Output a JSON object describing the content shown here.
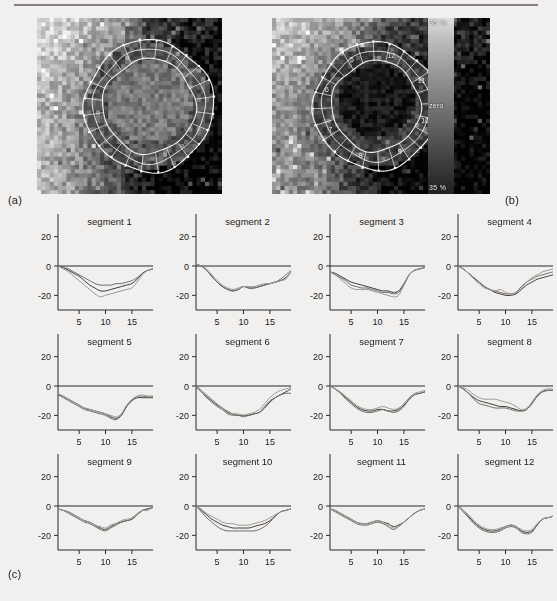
{
  "figure": {
    "panel_a_tag": "(a)",
    "panel_b_tag": "(b)",
    "panel_c_tag": "(c)"
  },
  "colorbar": {
    "top_label": "35 %",
    "mid_label": "zero",
    "bottom_label": "35 %",
    "high_color": "#dedede",
    "low_color": "#202020"
  },
  "mri": {
    "panel_a_name": "short-axis perfusion map with segmentation contours",
    "panel_b_name": "short-axis perfusion map with numbered segment contours",
    "segment_labels_on_image": [
      "12",
      "11",
      "10",
      "9",
      "8",
      "7",
      "6",
      "5"
    ]
  },
  "chart_data": {
    "type": "line",
    "title": "",
    "xlabel": "",
    "ylabel": "",
    "xlim": [
      1,
      19
    ],
    "ylim": [
      -30,
      30
    ],
    "xticks": [
      5,
      10,
      15
    ],
    "yticks": [
      20,
      0,
      -20
    ],
    "xtick_labels": [
      "5",
      "10",
      "15"
    ],
    "ytick_labels": [
      "20",
      "0",
      "-20"
    ],
    "grid": false,
    "legend": "none",
    "series_names": [
      "curve 1",
      "curve 2",
      "curve 3"
    ],
    "x": [
      1,
      2,
      3,
      4,
      5,
      6,
      7,
      8,
      9,
      10,
      11,
      12,
      13,
      14,
      15,
      16,
      17,
      18,
      19
    ],
    "panels": [
      {
        "title": "segment 1",
        "series": [
          {
            "name": "curve 1",
            "values": [
              0,
              -1,
              -3,
              -5,
              -7,
              -10,
              -13,
              -15,
              -17,
              -17,
              -16,
              -15,
              -14,
              -13,
              -12,
              -9,
              -5,
              -3,
              -2
            ]
          },
          {
            "name": "curve 2",
            "values": [
              0,
              -1,
              -2,
              -4,
              -6,
              -8,
              -10,
              -12,
              -13,
              -13,
              -13,
              -12,
              -12,
              -11,
              -10,
              -8,
              -5,
              -3,
              -2
            ]
          },
          {
            "name": "curve 3",
            "values": [
              0,
              -2,
              -4,
              -7,
              -10,
              -13,
              -16,
              -19,
              -21,
              -20,
              -19,
              -18,
              -17,
              -16,
              -15,
              -11,
              -6,
              -3,
              -2
            ]
          }
        ]
      },
      {
        "title": "segment 2",
        "series": [
          {
            "name": "curve 1",
            "values": [
              1,
              0,
              -3,
              -7,
              -11,
              -14,
              -16,
              -17,
              -16,
              -14,
              -15,
              -15,
              -14,
              -13,
              -12,
              -11,
              -10,
              -8,
              -4
            ]
          },
          {
            "name": "curve 2",
            "values": [
              1,
              0,
              -3,
              -7,
              -11,
              -14,
              -16,
              -17,
              -16,
              -14,
              -15,
              -15,
              -14,
              -13,
              -12,
              -11,
              -9,
              -6,
              -3
            ]
          },
          {
            "name": "curve 3",
            "values": [
              1,
              0,
              -2,
              -6,
              -10,
              -13,
              -15,
              -16,
              -15,
              -14,
              -14,
              -14,
              -13,
              -12,
              -12,
              -11,
              -10,
              -9,
              -4
            ]
          }
        ]
      },
      {
        "title": "segment 3",
        "series": [
          {
            "name": "curve 1",
            "values": [
              -4,
              -5,
              -7,
              -9,
              -11,
              -12,
              -13,
              -14,
              -15,
              -16,
              -17,
              -17,
              -18,
              -17,
              -12,
              -6,
              -3,
              -2,
              -1
            ]
          },
          {
            "name": "curve 2",
            "values": [
              -4,
              -6,
              -8,
              -10,
              -13,
              -14,
              -15,
              -15,
              -16,
              -17,
              -18,
              -18,
              -19,
              -18,
              -13,
              -6,
              -3,
              -2,
              -1
            ]
          },
          {
            "name": "curve 3",
            "values": [
              -4,
              -6,
              -9,
              -12,
              -15,
              -16,
              -16,
              -16,
              -17,
              -18,
              -19,
              -20,
              -21,
              -20,
              -13,
              -6,
              -3,
              -2,
              -1
            ]
          }
        ]
      },
      {
        "title": "segment 4",
        "series": [
          {
            "name": "curve 1",
            "values": [
              0,
              -2,
              -5,
              -8,
              -11,
              -14,
              -16,
              -18,
              -19,
              -20,
              -20,
              -19,
              -16,
              -13,
              -11,
              -9,
              -8,
              -7,
              -6
            ]
          },
          {
            "name": "curve 2",
            "values": [
              0,
              -2,
              -5,
              -8,
              -11,
              -14,
              -16,
              -17,
              -18,
              -19,
              -19,
              -18,
              -14,
              -11,
              -9,
              -7,
              -6,
              -5,
              -4
            ]
          },
          {
            "name": "curve 3",
            "values": [
              0,
              -2,
              -5,
              -9,
              -12,
              -15,
              -16,
              -17,
              -16,
              -18,
              -19,
              -18,
              -15,
              -11,
              -8,
              -6,
              -4,
              -3,
              -2
            ]
          }
        ]
      },
      {
        "title": "segment 5",
        "series": [
          {
            "name": "curve 1",
            "values": [
              -6,
              -7,
              -9,
              -11,
              -13,
              -15,
              -16,
              -17,
              -18,
              -19,
              -21,
              -22,
              -20,
              -14,
              -10,
              -8,
              -8,
              -8,
              -8
            ]
          },
          {
            "name": "curve 2",
            "values": [
              -6,
              -8,
              -10,
              -12,
              -14,
              -16,
              -17,
              -18,
              -19,
              -20,
              -22,
              -23,
              -20,
              -14,
              -10,
              -7,
              -7,
              -7,
              -7
            ]
          },
          {
            "name": "curve 3",
            "values": [
              -5,
              -7,
              -9,
              -11,
              -13,
              -15,
              -16,
              -17,
              -18,
              -19,
              -20,
              -21,
              -19,
              -13,
              -9,
              -7,
              -6,
              -7,
              -7
            ]
          }
        ]
      },
      {
        "title": "segment 6",
        "series": [
          {
            "name": "curve 1",
            "values": [
              0,
              -3,
              -7,
              -10,
              -13,
              -15,
              -18,
              -19,
              -20,
              -20,
              -20,
              -19,
              -18,
              -15,
              -11,
              -8,
              -6,
              -4,
              -2
            ]
          },
          {
            "name": "curve 2",
            "values": [
              -1,
              -4,
              -8,
              -11,
              -14,
              -16,
              -19,
              -20,
              -20,
              -21,
              -20,
              -19,
              -18,
              -14,
              -10,
              -8,
              -6,
              -5,
              -5
            ]
          },
          {
            "name": "curve 3",
            "values": [
              0,
              -3,
              -6,
              -9,
              -12,
              -15,
              -17,
              -19,
              -19,
              -20,
              -19,
              -18,
              -16,
              -12,
              -8,
              -5,
              -3,
              -2,
              -1
            ]
          }
        ]
      },
      {
        "title": "segment 7",
        "series": [
          {
            "name": "curve 1",
            "values": [
              0,
              -2,
              -5,
              -8,
              -11,
              -14,
              -16,
              -17,
              -17,
              -16,
              -16,
              -17,
              -17,
              -16,
              -13,
              -9,
              -6,
              -5,
              -4
            ]
          },
          {
            "name": "curve 2",
            "values": [
              0,
              -2,
              -5,
              -9,
              -12,
              -15,
              -17,
              -18,
              -18,
              -17,
              -16,
              -17,
              -18,
              -17,
              -14,
              -9,
              -6,
              -5,
              -4
            ]
          },
          {
            "name": "curve 3",
            "values": [
              0,
              -2,
              -4,
              -7,
              -10,
              -13,
              -15,
              -16,
              -16,
              -15,
              -14,
              -15,
              -16,
              -15,
              -12,
              -8,
              -5,
              -4,
              -3
            ]
          }
        ]
      },
      {
        "title": "segment 8",
        "series": [
          {
            "name": "curve 1",
            "values": [
              0,
              -2,
              -5,
              -8,
              -10,
              -11,
              -12,
              -13,
              -14,
              -14,
              -15,
              -16,
              -17,
              -16,
              -12,
              -7,
              -4,
              -3,
              -3
            ]
          },
          {
            "name": "curve 2",
            "values": [
              0,
              -2,
              -5,
              -9,
              -12,
              -13,
              -14,
              -15,
              -15,
              -15,
              -16,
              -17,
              -17,
              -16,
              -12,
              -7,
              -4,
              -3,
              -3
            ]
          },
          {
            "name": "curve 3",
            "values": [
              0,
              -1,
              -3,
              -6,
              -8,
              -9,
              -9,
              -9,
              -10,
              -11,
              -12,
              -14,
              -16,
              -15,
              -11,
              -6,
              -3,
              -2,
              -2
            ]
          }
        ]
      },
      {
        "title": "segment 9",
        "series": [
          {
            "name": "curve 1",
            "values": [
              -2,
              -3,
              -4,
              -6,
              -8,
              -10,
              -11,
              -13,
              -15,
              -16,
              -14,
              -12,
              -11,
              -10,
              -9,
              -6,
              -3,
              -2,
              -1
            ]
          },
          {
            "name": "curve 2",
            "values": [
              -2,
              -3,
              -5,
              -7,
              -9,
              -11,
              -12,
              -14,
              -16,
              -17,
              -15,
              -13,
              -11,
              -10,
              -9,
              -6,
              -3,
              -2,
              -1
            ]
          },
          {
            "name": "curve 3",
            "values": [
              -2,
              -3,
              -4,
              -6,
              -8,
              -10,
              -11,
              -13,
              -14,
              -15,
              -13,
              -12,
              -10,
              -9,
              -8,
              -5,
              -3,
              -3,
              -1
            ]
          }
        ]
      },
      {
        "title": "segment 10",
        "series": [
          {
            "name": "curve 1",
            "values": [
              0,
              -3,
              -6,
              -9,
              -11,
              -13,
              -14,
              -15,
              -15,
              -15,
              -15,
              -14,
              -13,
              -12,
              -10,
              -7,
              -4,
              -3,
              -2
            ]
          },
          {
            "name": "curve 2",
            "values": [
              0,
              -4,
              -8,
              -11,
              -14,
              -16,
              -17,
              -17,
              -17,
              -17,
              -17,
              -17,
              -16,
              -14,
              -11,
              -7,
              -4,
              -3,
              -2
            ]
          },
          {
            "name": "curve 3",
            "values": [
              0,
              -2,
              -5,
              -7,
              -9,
              -11,
              -12,
              -12,
              -13,
              -13,
              -13,
              -12,
              -11,
              -10,
              -8,
              -6,
              -4,
              -3,
              -2
            ]
          }
        ]
      },
      {
        "title": "segment 11",
        "series": [
          {
            "name": "curve 1",
            "values": [
              -2,
              -3,
              -5,
              -7,
              -9,
              -11,
              -12,
              -12,
              -11,
              -10,
              -11,
              -12,
              -14,
              -13,
              -11,
              -8,
              -5,
              -3,
              -2
            ]
          },
          {
            "name": "curve 2",
            "values": [
              -2,
              -4,
              -6,
              -8,
              -10,
              -12,
              -13,
              -13,
              -12,
              -11,
              -12,
              -14,
              -16,
              -14,
              -11,
              -8,
              -5,
              -3,
              -2
            ]
          },
          {
            "name": "curve 3",
            "values": [
              -2,
              -3,
              -5,
              -7,
              -9,
              -11,
              -12,
              -12,
              -11,
              -10,
              -11,
              -13,
              -15,
              -14,
              -11,
              -8,
              -5,
              -3,
              -2
            ]
          }
        ]
      },
      {
        "title": "segment 12",
        "series": [
          {
            "name": "curve 1",
            "values": [
              0,
              -3,
              -7,
              -11,
              -14,
              -16,
              -17,
              -17,
              -16,
              -14,
              -13,
              -14,
              -17,
              -18,
              -17,
              -13,
              -9,
              -8,
              -7
            ]
          },
          {
            "name": "curve 2",
            "values": [
              0,
              -4,
              -8,
              -12,
              -15,
              -17,
              -18,
              -18,
              -17,
              -15,
              -14,
              -15,
              -18,
              -19,
              -18,
              -13,
              -9,
              -8,
              -7
            ]
          },
          {
            "name": "curve 3",
            "values": [
              0,
              -3,
              -6,
              -10,
              -13,
              -15,
              -16,
              -16,
              -15,
              -14,
              -13,
              -14,
              -16,
              -17,
              -16,
              -12,
              -9,
              -8,
              -7
            ]
          }
        ]
      }
    ]
  }
}
